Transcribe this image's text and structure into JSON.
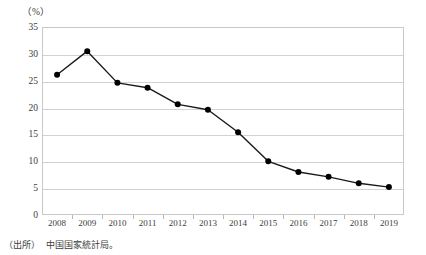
{
  "figure": {
    "unit_label": "（%）",
    "source_prefix": "（出所）",
    "source_text": "中国国家統計局。"
  },
  "chart_data": {
    "type": "line",
    "title": "",
    "subtitle": "",
    "xlabel": "",
    "ylabel": "",
    "unit": "%",
    "categories": [
      "2008",
      "2009",
      "2010",
      "2011",
      "2012",
      "2013",
      "2014",
      "2015",
      "2016",
      "2017",
      "2018",
      "2019"
    ],
    "values": [
      26.1,
      30.5,
      24.6,
      23.7,
      20.6,
      19.6,
      15.4,
      10.0,
      8.0,
      7.1,
      5.9,
      5.2
    ],
    "series": [
      {
        "name": "",
        "values": [
          26.1,
          30.5,
          24.6,
          23.7,
          20.6,
          19.6,
          15.4,
          10.0,
          8.0,
          7.1,
          5.9,
          5.2
        ]
      }
    ],
    "ylim": [
      0,
      35
    ],
    "yticks": [
      0,
      5,
      10,
      15,
      20,
      25,
      30,
      35
    ],
    "ytick_labels": [
      "0",
      "5",
      "10",
      "15",
      "20",
      "25",
      "30",
      "35"
    ],
    "grid": true,
    "legend": false,
    "marker": "filled-circle",
    "line_color": "#1a1a1a",
    "marker_color": "#000000",
    "grid_color": "#d2d2d2",
    "axis_color": "#c9c9c9"
  }
}
